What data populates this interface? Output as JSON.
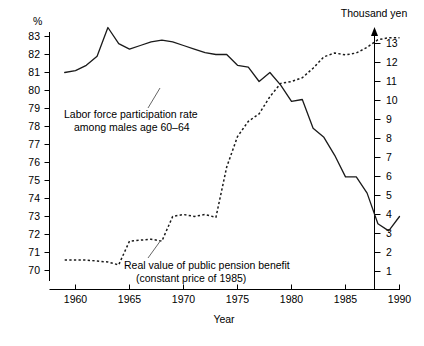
{
  "chart_data": {
    "type": "line",
    "title": "",
    "xlabel": "Year",
    "ylabel_left": "%",
    "ylabel_right": "Thousand yen",
    "xlim": [
      1958.6,
      1990.6
    ],
    "ylim_left": [
      70,
      83.6
    ],
    "ylim_right": [
      0.55,
      13.6
    ],
    "xticks": [
      1960,
      1965,
      1970,
      1975,
      1980,
      1985,
      1990
    ],
    "xtick_labels": [
      "1960",
      "1965",
      "1970",
      "1975",
      "1980",
      "1985",
      "1990"
    ],
    "yticks_left": [
      70,
      71,
      72,
      73,
      74,
      75,
      76,
      77,
      78,
      79,
      80,
      81,
      82,
      83
    ],
    "ytick_labels_left": [
      "70",
      "71",
      "72",
      "73",
      "74",
      "75",
      "76",
      "77",
      "78",
      "79",
      "80",
      "81",
      "82",
      "83"
    ],
    "yticks_right": [
      1,
      2,
      3,
      4,
      5,
      6,
      7,
      8,
      9,
      10,
      11,
      12,
      13
    ],
    "ytick_labels_right": [
      "1",
      "2",
      "3",
      "4",
      "5",
      "6",
      "7",
      "8",
      "9",
      "10",
      "11",
      "12",
      "13"
    ],
    "grid": false,
    "legend_position": "inline-annotation",
    "series": [
      {
        "name": "Labor force participation rate among males age 60-64",
        "style": "solid",
        "axis": "left",
        "unit": "%",
        "x": [
          1959,
          1960,
          1961,
          1962,
          1963,
          1964,
          1965,
          1966,
          1967,
          1968,
          1969,
          1970,
          1971,
          1972,
          1973,
          1974,
          1975,
          1976,
          1977,
          1978,
          1979,
          1980,
          1981,
          1982,
          1983,
          1984,
          1985,
          1986,
          1987,
          1988,
          1989,
          1990
        ],
        "values": [
          81.0,
          81.1,
          81.4,
          81.9,
          83.5,
          82.6,
          82.3,
          82.5,
          82.7,
          82.8,
          82.7,
          82.5,
          82.3,
          82.1,
          82.0,
          82.0,
          81.4,
          81.3,
          80.5,
          81.0,
          80.3,
          79.4,
          79.5,
          77.9,
          77.4,
          76.4,
          75.2,
          75.2,
          74.3,
          72.6,
          72.2,
          73.0
        ]
      },
      {
        "name": "Real value of public pension benefit (constant price of 1985)",
        "style": "dotted",
        "axis": "right",
        "unit": "Thousand yen",
        "x": [
          1959,
          1960,
          1961,
          1962,
          1963,
          1964,
          1965,
          1966,
          1967,
          1968,
          1969,
          1970,
          1971,
          1972,
          1973,
          1974,
          1975,
          1976,
          1977,
          1978,
          1979,
          1980,
          1981,
          1982,
          1983,
          1984,
          1985,
          1986,
          1987,
          1988,
          1989,
          1990
        ],
        "values": [
          1.6,
          1.6,
          1.6,
          1.55,
          1.5,
          1.35,
          2.6,
          2.65,
          2.7,
          2.6,
          3.9,
          4.0,
          3.9,
          4.0,
          3.85,
          6.5,
          8.1,
          8.9,
          9.3,
          10.2,
          10.9,
          11.0,
          11.2,
          11.7,
          12.3,
          12.5,
          12.4,
          12.5,
          12.8,
          13.2,
          13.3,
          13.3
        ]
      }
    ],
    "annotations": [
      {
        "id": "annot-labor",
        "lines": [
          "Labor force participation rate",
          "among males age 60–64"
        ],
        "target_series": "Labor force participation rate among males age 60-64"
      },
      {
        "id": "annot-pension",
        "lines": [
          "Real value of public pension benefit",
          "(constant price of 1985)"
        ],
        "target_series": "Real value of public pension benefit (constant price of 1985)"
      }
    ]
  }
}
